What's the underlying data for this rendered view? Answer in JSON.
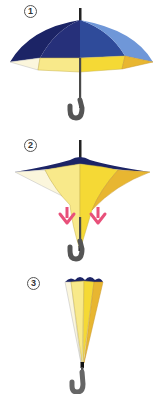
{
  "steps": [
    {
      "number": "1",
      "state": "open",
      "description": "open-umbrella"
    },
    {
      "number": "2",
      "state": "inverting",
      "description": "canopy-folding-downward"
    },
    {
      "number": "3",
      "state": "closed",
      "description": "closed-inverted-umbrella"
    }
  ],
  "colors": {
    "outer_dark_navy": "#1c2466",
    "outer_mid_blue": "#2f4b9a",
    "outer_light_blue": "#6f97d8",
    "inner_pale": "#fbf6dc",
    "inner_light_yellow": "#f8e98a",
    "inner_yellow": "#f5d935",
    "inner_gold": "#e8b631",
    "shaft": "#4a4a4a",
    "handle": "#555555",
    "arrow_pink": "#e8507a"
  },
  "icons": {
    "arrow_left": "down-arrow",
    "arrow_right": "down-arrow"
  }
}
